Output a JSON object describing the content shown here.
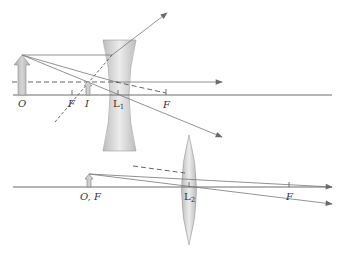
{
  "figure": {
    "top_diagram": {
      "lens": {
        "name": "L",
        "subscript": "1",
        "type": "diverging (concave)"
      },
      "labels": {
        "object": "O",
        "focal_left": "F",
        "image": "I",
        "focal_right": "F"
      }
    },
    "bottom_diagram": {
      "lens": {
        "name": "L",
        "subscript": "2",
        "type": "converging (convex)"
      },
      "labels": {
        "object": "O, F",
        "focal_right": "F"
      }
    }
  },
  "colors": {
    "axis": "#6d6d6d",
    "ray": "#777777",
    "arrow_fill": "#b9b9b9",
    "lens_fill": "#d4d4d4",
    "text": "#333333"
  }
}
